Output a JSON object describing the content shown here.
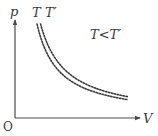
{
  "diagram": {
    "y_axis_label": "p",
    "x_axis_label": "V",
    "origin_label": "O",
    "relation_label": "T<T′",
    "curves": [
      {
        "name": "T",
        "label": "T",
        "style": "dotted",
        "k": 1.0
      },
      {
        "name": "T-prime",
        "label": "T′",
        "style": "dotted",
        "k": 1.35
      }
    ],
    "colors": {
      "line": "#3c3c3c",
      "axis": "#4a4a4a",
      "text": "#3a3a3a"
    }
  }
}
